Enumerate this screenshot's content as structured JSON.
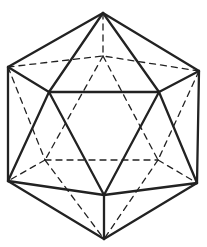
{
  "diagram": {
    "type": "icosahedron-wireframe",
    "stroke_color": "#222222",
    "background": "#ffffff",
    "vertices": {
      "T": [
        103,
        13
      ],
      "L": [
        8,
        67
      ],
      "R": [
        199,
        71
      ],
      "IL": [
        49,
        92
      ],
      "IR": [
        159,
        92
      ],
      "LL": [
        8,
        181
      ],
      "LR": [
        197,
        183
      ],
      "BF": [
        104,
        195
      ],
      "B": [
        104,
        239
      ],
      "BK": [
        103,
        56
      ],
      "HL": [
        45,
        160
      ],
      "HR": [
        158,
        160
      ]
    },
    "visible_edges": [
      [
        "T",
        "L"
      ],
      [
        "T",
        "R"
      ],
      [
        "T",
        "IL"
      ],
      [
        "T",
        "IR"
      ],
      [
        "L",
        "IL"
      ],
      [
        "R",
        "IR"
      ],
      [
        "IL",
        "IR"
      ],
      [
        "L",
        "LL"
      ],
      [
        "R",
        "LR"
      ],
      [
        "IL",
        "LL"
      ],
      [
        "IL",
        "BF"
      ],
      [
        "IR",
        "BF"
      ],
      [
        "IR",
        "LR"
      ],
      [
        "LL",
        "BF"
      ],
      [
        "LR",
        "BF"
      ],
      [
        "LL",
        "B"
      ],
      [
        "LR",
        "B"
      ],
      [
        "BF",
        "B"
      ]
    ],
    "hidden_edges": [
      [
        "T",
        "BK"
      ],
      [
        "L",
        "BK"
      ],
      [
        "R",
        "BK"
      ],
      [
        "BK",
        "HL"
      ],
      [
        "BK",
        "HR"
      ],
      [
        "L",
        "HL"
      ],
      [
        "R",
        "HR"
      ],
      [
        "HL",
        "HR"
      ],
      [
        "HL",
        "LL"
      ],
      [
        "HR",
        "LR"
      ],
      [
        "HL",
        "B"
      ],
      [
        "HR",
        "B"
      ]
    ]
  }
}
